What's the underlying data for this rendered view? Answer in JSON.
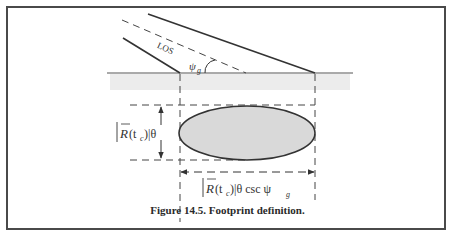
{
  "figure": {
    "caption": "Figure 14.5. Footprint definition.",
    "labels": {
      "los": "LOS",
      "grazing_angle_symbol": "ψ",
      "grazing_angle_subscript": "g",
      "height_label_prefix": "R",
      "height_label_arg": "(t",
      "height_label_sub": "c",
      "height_label_suffix": ")|θ",
      "width_label_suffix": ")|θ csc ψ",
      "width_label_sub2": "g"
    },
    "colors": {
      "line": "#333333",
      "ground_band": "#e9e9e9",
      "ellipse_fill": "#d8d8d8",
      "frame": "#4a4a4a"
    }
  }
}
